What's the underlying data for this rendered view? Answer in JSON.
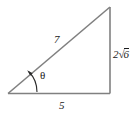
{
  "figure": {
    "type": "right-triangle-diagram",
    "stroke_color": "#808080",
    "text_color": "#1a1a1a",
    "background_color": "#ffffff",
    "labels": {
      "hypotenuse": "7",
      "base": "5",
      "height_coefficient": "2",
      "height_radical_sign": "√",
      "height_radicand": "6",
      "height_full": "2√6",
      "angle": "θ"
    },
    "geometry": {
      "vertex_left": [
        8,
        93
      ],
      "vertex_bottom_right": [
        110,
        93
      ],
      "vertex_top_right": [
        110,
        7
      ],
      "angle_arc_center": [
        8,
        93
      ],
      "angle_arc_radius": 28
    }
  }
}
